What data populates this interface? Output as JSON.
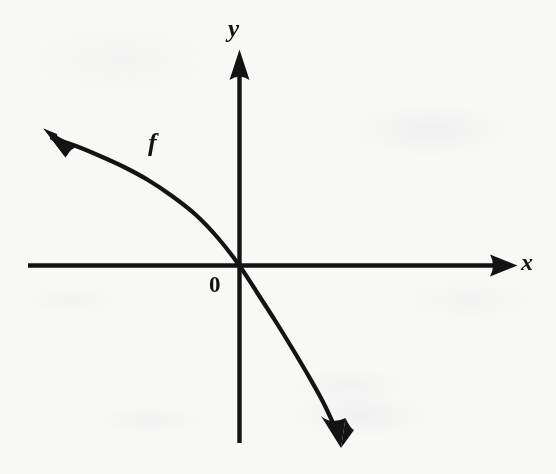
{
  "figure": {
    "background_color": "#f8f8f7",
    "ink_color": "#131313"
  },
  "labels": {
    "y_axis": "y",
    "x_axis": "x",
    "origin": "0",
    "curve": "f"
  },
  "chart_data": {
    "type": "line",
    "title": "",
    "subtitle": "",
    "xlabel": "x",
    "ylabel": "y",
    "grid": false,
    "legend": "none",
    "annotations": [
      {
        "text": "f",
        "x_px": 155,
        "y_px": 145,
        "describes": "curve-name"
      },
      {
        "text": "0",
        "x_px": 217,
        "y_px": 285,
        "describes": "origin-marker"
      },
      {
        "text": "y",
        "x_px": 237,
        "y_px": 28,
        "describes": "y-axis-name"
      },
      {
        "text": "x",
        "x_px": 527,
        "y_px": 262,
        "describes": "x-axis-name"
      }
    ],
    "axes": {
      "origin_px": [
        239,
        265
      ],
      "x_axis_px": {
        "from": [
          28,
          265
        ],
        "to": [
          517,
          265
        ],
        "arrow": "end"
      },
      "y_axis_px": {
        "from": [
          239,
          443
        ],
        "to": [
          239,
          50
        ],
        "arrow": "start-top"
      },
      "xlim": [
        -4.2,
        4.8
      ],
      "ylim": [
        -3.4,
        4.1
      ],
      "ticks": [],
      "tick_labels": []
    },
    "series": [
      {
        "name": "f",
        "description": "strictly decreasing concave-down curve through the origin, rising to the upper-left and falling to the lower-right, with arrowheads at both ends",
        "arrow_start": true,
        "arrow_end": true,
        "points_px": [
          [
            52,
            138
          ],
          [
            76,
            146
          ],
          [
            100,
            156
          ],
          [
            124,
            167
          ],
          [
            148,
            180
          ],
          [
            172,
            196
          ],
          [
            196,
            215
          ],
          [
            218,
            238
          ],
          [
            239,
            265
          ],
          [
            258,
            294
          ],
          [
            276,
            322
          ],
          [
            292,
            348
          ],
          [
            308,
            375
          ],
          [
            322,
            400
          ],
          [
            333,
            423
          ],
          [
            340,
            440
          ]
        ],
        "points_data": [
          [
            -3.4,
            2.4
          ],
          [
            -3.0,
            2.25
          ],
          [
            -2.6,
            2.05
          ],
          [
            -2.2,
            1.85
          ],
          [
            -1.8,
            1.6
          ],
          [
            -1.4,
            1.3
          ],
          [
            -1.0,
            0.95
          ],
          [
            -0.4,
            0.5
          ],
          [
            0.0,
            0.0
          ],
          [
            0.35,
            -0.55
          ],
          [
            0.7,
            -1.1
          ],
          [
            1.0,
            -1.6
          ],
          [
            1.3,
            -2.1
          ],
          [
            1.6,
            -2.6
          ],
          [
            1.8,
            -3.0
          ],
          [
            1.9,
            -3.3
          ]
        ]
      }
    ]
  }
}
